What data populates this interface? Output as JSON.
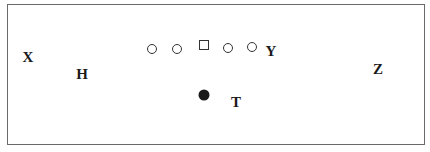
{
  "diagram": {
    "type": "football-formation",
    "labels": {
      "x": "X",
      "h": "H",
      "y": "Y",
      "z": "Z",
      "t": "T"
    },
    "linemen": [
      "tackle",
      "guard",
      "center",
      "guard",
      "tackle"
    ],
    "quarterback": "filled-dot"
  }
}
